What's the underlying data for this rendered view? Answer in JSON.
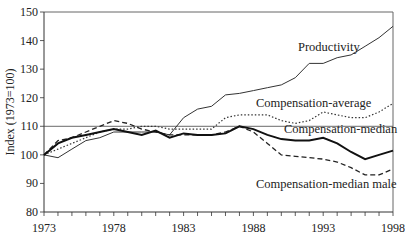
{
  "chart_data": {
    "type": "line",
    "title": "",
    "xlabel": "",
    "ylabel": "Index (1973=100)",
    "xlim": [
      1973,
      1998
    ],
    "ylim": [
      80,
      150
    ],
    "x_ticks": [
      "1973",
      "1978",
      "1983",
      "1988",
      "1993",
      "1998"
    ],
    "y_ticks": [
      "80",
      "90",
      "100",
      "110",
      "120",
      "130",
      "140",
      "150"
    ],
    "grid": false,
    "reference_line": 100,
    "legend": "inline labels",
    "x": [
      1973,
      1974,
      1975,
      1976,
      1977,
      1978,
      1979,
      1980,
      1981,
      1982,
      1983,
      1984,
      1985,
      1986,
      1987,
      1988,
      1989,
      1990,
      1991,
      1992,
      1993,
      1994,
      1995,
      1996,
      1997,
      1998
    ],
    "series": [
      {
        "name": "Productivity",
        "style": "solid-thin",
        "values": [
          100,
          99,
          102,
          105,
          106,
          108,
          108,
          108,
          108,
          107,
          113,
          116,
          117,
          121,
          121.5,
          122.5,
          123.5,
          124.5,
          127,
          132,
          132,
          134,
          135,
          138,
          141,
          145
        ]
      },
      {
        "name": "Compensation-average",
        "style": "dotted",
        "values": [
          100,
          102,
          104,
          106,
          108,
          109,
          109,
          110,
          110,
          109,
          109,
          109,
          109,
          113,
          114,
          114,
          114,
          112,
          111,
          112,
          115,
          114,
          113,
          113,
          115,
          118
        ]
      },
      {
        "name": "Compensation-median",
        "style": "solid-thick",
        "values": [
          100,
          104,
          106,
          107,
          108,
          109,
          108,
          107,
          108.5,
          106,
          107.5,
          107,
          107,
          107.5,
          110,
          109,
          107,
          105.5,
          105,
          105,
          106,
          104,
          101,
          98.5,
          100,
          101.5
        ]
      },
      {
        "name": "Compensation-median male",
        "style": "dashed",
        "values": [
          100,
          105,
          106,
          108,
          110,
          112,
          111,
          109,
          108,
          107,
          107,
          107,
          107,
          108,
          110,
          108,
          104,
          100,
          99.5,
          99,
          98.5,
          97.5,
          95.5,
          93,
          93,
          95
        ]
      }
    ],
    "annotations": [
      {
        "text": "Productivity",
        "x": 1993,
        "y": 136
      },
      {
        "text": "Compensation-average",
        "x": 1990.5,
        "y": 117
      },
      {
        "text": "Compensation-median",
        "x": 1992.5,
        "y": 109
      },
      {
        "text": "Compensation-median male",
        "x": 1991,
        "y": 91
      }
    ]
  },
  "labels": {
    "ylabel": "Index (1973=100)",
    "productivity": "Productivity",
    "comp_average": "Compensation-average",
    "comp_median": "Compensation-median",
    "comp_median_male": "Compensation-median male",
    "x_ticks": [
      "1973",
      "1978",
      "1983",
      "1988",
      "1993",
      "1998"
    ],
    "y_ticks": [
      "150",
      "140",
      "130",
      "120",
      "110",
      "100",
      "90",
      "80"
    ]
  }
}
